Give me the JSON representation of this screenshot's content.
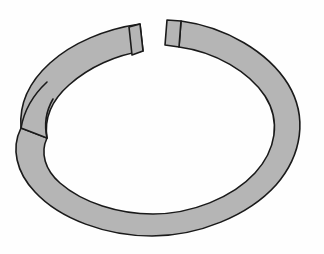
{
  "figure": {
    "subject_name": "split-ring-washer",
    "view": "oblique perspective from slightly above",
    "render_style": "flat-shaded line drawing",
    "canvas": {
      "width": 324,
      "height": 254,
      "background_color": "#fefefe"
    },
    "colors": {
      "band_fill": "#b5b5b5",
      "outline": "#1a1a1a",
      "interior": "#ffffff",
      "background": "#fefefe"
    },
    "stroke_width": 1.6,
    "geometry": {
      "center_x": 159,
      "center_y": 128,
      "outer_radius_x": 139,
      "outer_radius_y": 107,
      "inner_radius_x": 111,
      "inner_radius_y": 79,
      "band_width": 28,
      "gap_left_edge_x": 115,
      "gap_right_edge_x": 181,
      "gap_top_y": 20,
      "crossover_point_x": 27,
      "crossover_point_y": 117,
      "bottom_extent_y": 236,
      "left_extent_x": 20,
      "right_extent_x": 298
    },
    "parts": [
      {
        "id": "outer-band",
        "label": "Outer band surface"
      },
      {
        "id": "left-end-face",
        "label": "Left terminal end face"
      },
      {
        "id": "right-end-face",
        "label": "Right terminal end face"
      },
      {
        "id": "gap",
        "label": "Split gap"
      },
      {
        "id": "crossover",
        "label": "Self-crossing overlap"
      }
    ]
  }
}
